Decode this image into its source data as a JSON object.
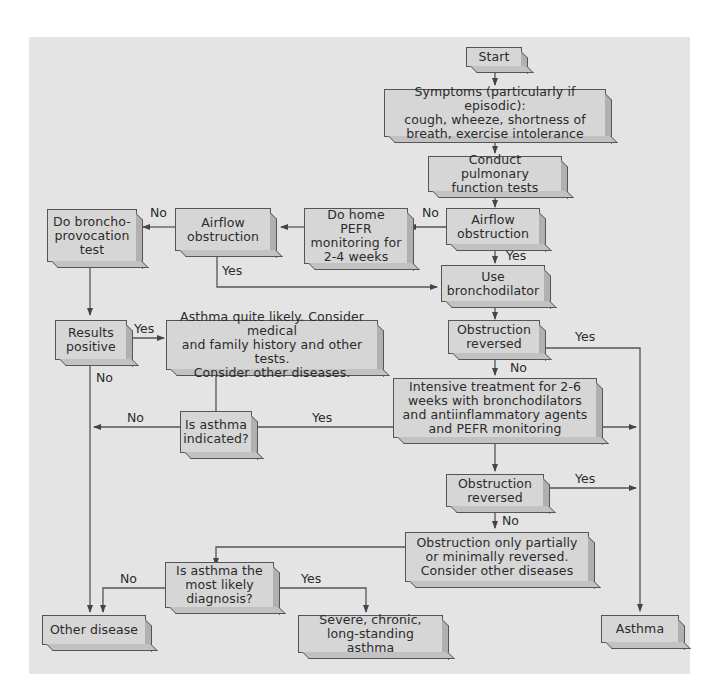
{
  "flowchart": {
    "nodes": {
      "start": "Start",
      "symptoms": "Symptoms (particularly if episodic):\ncough, wheeze, shortness of\nbreath, exercise intolerance",
      "pft": "Conduct pulmonary\nfunction tests",
      "airflow1": "Airflow\nobstruction",
      "pefr": "Do home\nPEFR\nmonitoring for\n2-4 weeks",
      "airflow2": "Airflow\nobstruction",
      "broncho_provocation": "Do broncho-\nprovocation\ntest",
      "use_bronchodilator": "Use\nbronchodilator",
      "obstruction_reversed1": "Obstruction\nreversed",
      "results_positive": "Results\npositive",
      "asthma_likely": "Asthma quite likely. Consider medical\nand family history and other tests.\nConsider other diseases.",
      "intensive": "Intensive treatment for 2-6\nweeks with bronchodilators\nand antiinflammatory agents\nand PEFR monitoring",
      "is_asthma_indicated": "Is asthma\nindicated?",
      "obstruction_reversed2": "Obstruction\nreversed",
      "partially_reversed": "Obstruction only partially\nor minimally reversed.\nConsider other diseases",
      "most_likely": "Is asthma the\nmost likely\ndiagnosis?",
      "other_disease": "Other disease",
      "severe": "Severe, chronic,\nlong-standing asthma",
      "asthma": "Asthma"
    },
    "edge_labels": {
      "airflow1_no": "No",
      "airflow1_yes": "Yes",
      "airflow2_no": "No",
      "airflow2_yes": "Yes",
      "reversed1_yes": "Yes",
      "reversed1_no": "No",
      "results_yes": "Yes",
      "results_no": "No",
      "indicated_no": "No",
      "indicated_yes": "Yes",
      "reversed2_yes": "Yes",
      "reversed2_no": "No",
      "likely_no": "No",
      "likely_yes": "Yes"
    }
  }
}
